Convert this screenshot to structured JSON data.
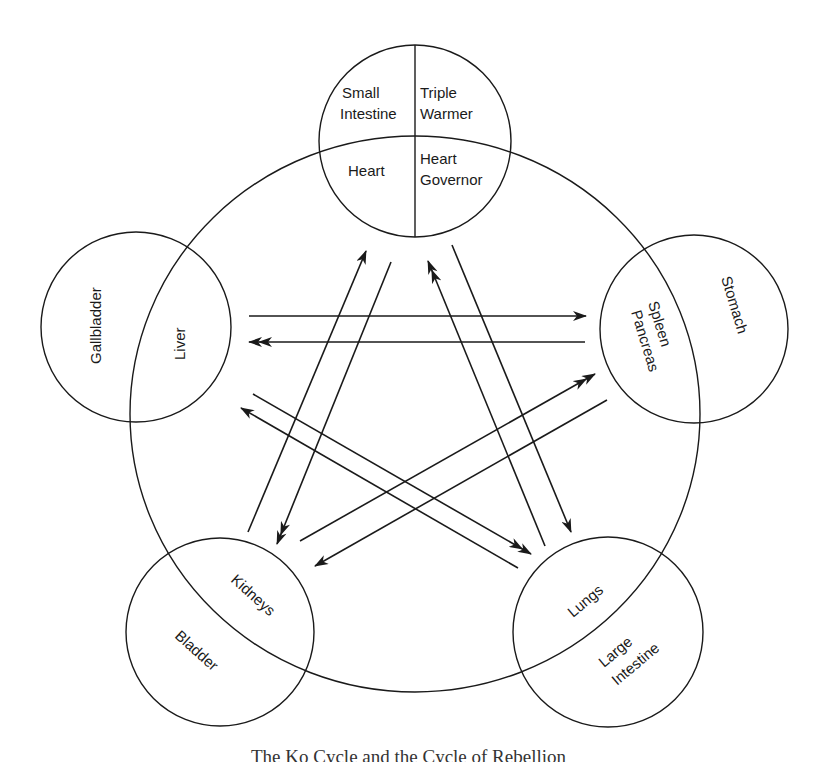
{
  "diagram": {
    "title": "The Ko Cycle and the Cycle of Rebellion",
    "line_color": "#1a1a1a",
    "background": "#ffffff",
    "elements": {
      "fire": {
        "top_left": "Small Intestine",
        "top_left_1": "Small",
        "top_left_2": "Intestine",
        "top_right_1": "Triple",
        "top_right_2": "Warmer",
        "bottom_left": "Heart",
        "bottom_right_1": "Heart",
        "bottom_right_2": "Governor"
      },
      "wood": {
        "outer": "Gallbladder",
        "inner": "Liver"
      },
      "earth": {
        "outer": "Stomach",
        "inner_1": "Spleen",
        "inner_2": "Pancreas"
      },
      "water": {
        "outer": "Bladder",
        "inner": "Kidneys"
      },
      "metal": {
        "inner": "Lungs",
        "outer_1": "Large",
        "outer_2": "Intestine"
      }
    },
    "arrows": [
      {
        "from": "Liver",
        "to": "Spleen Pancreas",
        "head": "single"
      },
      {
        "from": "Spleen Pancreas",
        "to": "Liver",
        "head": "double"
      },
      {
        "from": "Kidneys",
        "to": "Heart",
        "head": "single"
      },
      {
        "from": "Heart",
        "to": "Kidneys",
        "head": "double"
      },
      {
        "from": "Lungs",
        "to": "Heart",
        "head": "double"
      },
      {
        "from": "Heart",
        "to": "Lungs",
        "head": "single"
      },
      {
        "from": "Liver",
        "to": "Lungs",
        "head": "double"
      },
      {
        "from": "Lungs",
        "to": "Liver",
        "head": "single"
      },
      {
        "from": "Kidneys",
        "to": "Spleen Pancreas",
        "head": "double"
      },
      {
        "from": "Spleen Pancreas",
        "to": "Kidneys",
        "head": "single"
      }
    ]
  }
}
